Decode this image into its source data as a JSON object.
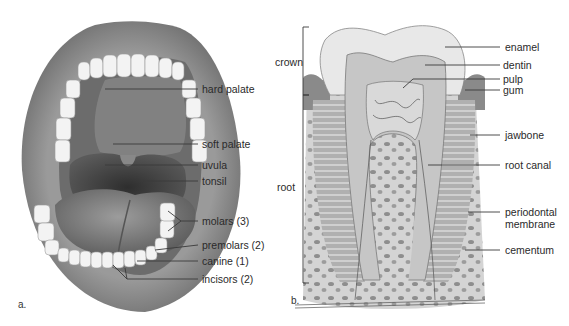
{
  "figure_a": {
    "panel_letter": "a.",
    "subject": "open mouth",
    "labels": [
      {
        "id": "hard-palate",
        "text": "hard palate"
      },
      {
        "id": "soft-palate",
        "text": "soft palate"
      },
      {
        "id": "uvula",
        "text": "uvula"
      },
      {
        "id": "tonsil",
        "text": "tonsil"
      },
      {
        "id": "molars",
        "text": "molars (3)"
      },
      {
        "id": "premolars",
        "text": "premolars (2)"
      },
      {
        "id": "canine",
        "text": "canine (1)"
      },
      {
        "id": "incisors",
        "text": "incisors (2)"
      }
    ]
  },
  "figure_b": {
    "panel_letter": "b.",
    "subject": "tooth cross-section (molar)",
    "brackets": [
      {
        "id": "crown",
        "text": "crown"
      },
      {
        "id": "root",
        "text": "root"
      }
    ],
    "labels": [
      {
        "id": "enamel",
        "text": "enamel"
      },
      {
        "id": "dentin",
        "text": "dentin"
      },
      {
        "id": "pulp",
        "text": "pulp"
      },
      {
        "id": "gum",
        "text": "gum"
      },
      {
        "id": "jawbone",
        "text": "jawbone"
      },
      {
        "id": "root-canal",
        "text": "root canal"
      },
      {
        "id": "periodontal-membrane-line1",
        "text": "periodontal"
      },
      {
        "id": "periodontal-membrane-line2",
        "text": "membrane"
      },
      {
        "id": "cementum",
        "text": "cementum"
      }
    ]
  },
  "colors": {
    "leader_line": "#3a3a3a",
    "lips": "#8c8c8c",
    "mouth_cavity": "#4a4a4a",
    "teeth": "#f2f2f2",
    "enamel": "#e6e6e6",
    "dentin": "#c4c4c4",
    "pulp": "#d8d8d8",
    "bone": "#b8b8b8"
  }
}
